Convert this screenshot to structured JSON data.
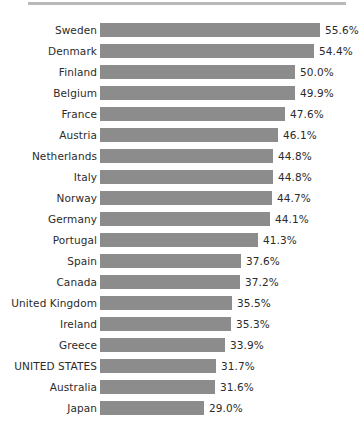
{
  "chart_data": {
    "type": "bar",
    "orientation": "horizontal",
    "title": "",
    "subtitle": "",
    "xlabel": "",
    "ylabel": "",
    "grid": false,
    "legend": false,
    "axis_visible": false,
    "value_suffix": "%",
    "xlim": [
      5,
      61
    ],
    "categories": [
      "Sweden",
      "Denmark",
      "Finland",
      "Belgium",
      "France",
      "Austria",
      "Netherlands",
      "Italy",
      "Norway",
      "Germany",
      "Portugal",
      "Spain",
      "Canada",
      "United Kingdom",
      "Ireland",
      "Greece",
      "UNITED STATES",
      "Australia",
      "Japan"
    ],
    "values": [
      55.6,
      54.4,
      50.0,
      49.9,
      47.6,
      46.1,
      44.8,
      44.8,
      44.7,
      44.1,
      41.3,
      37.6,
      37.2,
      35.5,
      35.3,
      33.9,
      31.7,
      31.6,
      29.0
    ],
    "value_labels": [
      "55.6%",
      "54.4%",
      "50.0%",
      "49.9%",
      "47.6%",
      "46.1%",
      "44.8%",
      "44.8%",
      "44.7%",
      "44.1%",
      "41.3%",
      "37.6%",
      "37.2%",
      "35.5%",
      "35.3%",
      "33.9%",
      "31.7%",
      "31.6%",
      "29.0%"
    ],
    "highlighted_category": "UNITED STATES",
    "colors": {
      "bar": "#8c8c8c",
      "text": "#2b2b2b",
      "background": "#ffffff",
      "top_rule": "#b9b9b9"
    }
  }
}
